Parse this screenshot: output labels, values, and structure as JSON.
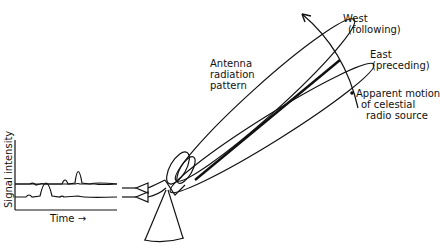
{
  "diagram": {
    "labels": {
      "west": "West",
      "west_sub": "(following)",
      "east": "East",
      "east_sub": "(preceding)",
      "antenna_line1": "Antenna",
      "antenna_line2": "radiation",
      "antenna_line3": "pattern",
      "motion_line1": "Apparent motion",
      "motion_line2": "of celestial",
      "motion_line3": "radio source",
      "y_axis": "Signal intensity",
      "x_axis": "Time →"
    },
    "components": [
      "antenna-dish",
      "antenna-mount",
      "two-lobe radiation pattern",
      "two receivers",
      "signal trace plot"
    ],
    "line_color": "#111111"
  }
}
